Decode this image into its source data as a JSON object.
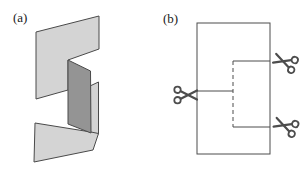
{
  "figure": {
    "panel_a": {
      "label": "(a)"
    },
    "panel_b": {
      "label": "(b)"
    }
  },
  "icons": {
    "scissors": "✂"
  },
  "colors": {
    "paper_light": "#d4d4d4",
    "paper_dark": "#949494",
    "outline": "#4a4a4a",
    "line": "#4d4d4d",
    "background": "#ffffff",
    "label_text": "#1a1a1a"
  }
}
